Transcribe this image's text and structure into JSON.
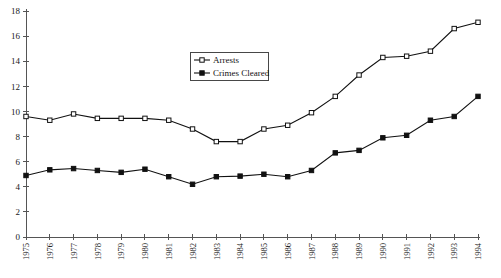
{
  "chart_data": {
    "type": "line",
    "title": "",
    "subtitle": "",
    "xlabel": "",
    "ylabel": "",
    "x": [
      "1975",
      "1976",
      "1977",
      "1978",
      "1979",
      "1980",
      "1981",
      "1982",
      "1983",
      "1984",
      "1985",
      "1986",
      "1987",
      "1988",
      "1989",
      "1990",
      "1991",
      "1992",
      "1993",
      "1994"
    ],
    "categories": [
      "1975",
      "1976",
      "1977",
      "1978",
      "1979",
      "1980",
      "1981",
      "1982",
      "1983",
      "1984",
      "1985",
      "1986",
      "1987",
      "1988",
      "1989",
      "1990",
      "1991",
      "1992",
      "1993",
      "1994"
    ],
    "series": [
      {
        "name": "Arrests",
        "marker": "open-square",
        "color": "#111111",
        "values": [
          9.6,
          9.3,
          9.8,
          9.45,
          9.45,
          9.45,
          9.3,
          8.6,
          7.6,
          7.6,
          8.6,
          8.9,
          9.9,
          11.2,
          12.9,
          14.3,
          14.4,
          14.8,
          16.6,
          17.1
        ]
      },
      {
        "name": "Crimes Cleared",
        "marker": "filled-square",
        "color": "#111111",
        "values": [
          4.9,
          5.35,
          5.45,
          5.3,
          5.15,
          5.4,
          4.8,
          4.2,
          4.8,
          4.85,
          5.0,
          4.8,
          5.3,
          6.7,
          6.9,
          7.9,
          8.1,
          9.3,
          9.6,
          11.2
        ]
      }
    ],
    "ylim": [
      0,
      18
    ],
    "xlim": [
      "1975",
      "1994"
    ],
    "yticks": [
      0,
      2,
      4,
      6,
      8,
      10,
      12,
      14,
      16,
      18
    ],
    "ytick_labels": [
      "0",
      "2",
      "4",
      "6",
      "8",
      "10",
      "12",
      "14",
      "16",
      "18"
    ],
    "grid": false,
    "legend_position": "upper-center",
    "legend_entries": [
      "Arrests",
      "Crimes Cleared"
    ]
  },
  "axes": {
    "y_axis_name": "y-axis",
    "x_axis_name": "x-axis"
  },
  "legend": {
    "items": [
      {
        "label": "Arrests",
        "marker": "open-square"
      },
      {
        "label": "Crimes Cleared",
        "marker": "filled-square"
      }
    ]
  }
}
